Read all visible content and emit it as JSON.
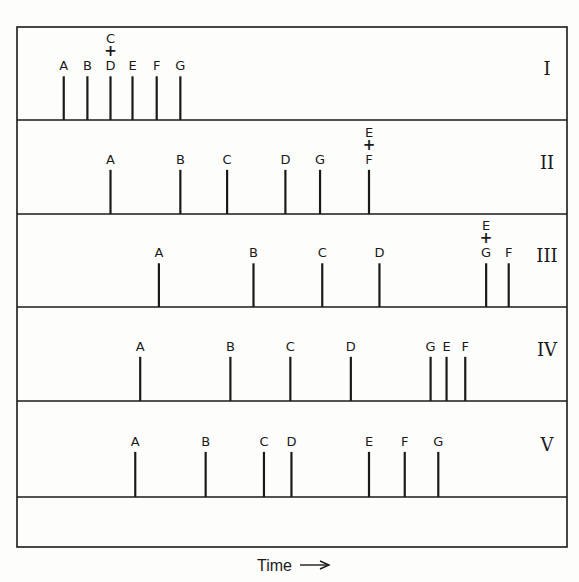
{
  "chart_data": {
    "type": "chromatogram-stick",
    "title": "",
    "xlabel": "Time",
    "x_unit": "relative elution time (arbitrary, left to right)",
    "xlim": [
      0,
      100
    ],
    "panels": [
      {
        "name": "I",
        "peaks": [
          {
            "label": "A",
            "t": 8.5
          },
          {
            "label": "B",
            "t": 12.8
          },
          {
            "label": "C+D",
            "t": 17.0,
            "stack": [
              "C",
              "D"
            ]
          },
          {
            "label": "E",
            "t": 21.0
          },
          {
            "label": "F",
            "t": 25.4
          },
          {
            "label": "G",
            "t": 29.7
          }
        ]
      },
      {
        "name": "II",
        "peaks": [
          {
            "label": "A",
            "t": 17.0
          },
          {
            "label": "B",
            "t": 29.7
          },
          {
            "label": "C",
            "t": 38.2
          },
          {
            "label": "D",
            "t": 48.8
          },
          {
            "label": "G",
            "t": 55.1
          },
          {
            "label": "E+F",
            "t": 64.0,
            "stack": [
              "E",
              "F"
            ]
          }
        ]
      },
      {
        "name": "III",
        "peaks": [
          {
            "label": "A",
            "t": 25.8
          },
          {
            "label": "B",
            "t": 43.0
          },
          {
            "label": "C",
            "t": 55.5
          },
          {
            "label": "D",
            "t": 65.9
          },
          {
            "label": "E+G",
            "t": 85.3,
            "stack": [
              "E",
              "G"
            ]
          },
          {
            "label": "F",
            "t": 89.4
          }
        ]
      },
      {
        "name": "IV",
        "peaks": [
          {
            "label": "A",
            "t": 22.4
          },
          {
            "label": "B",
            "t": 38.8
          },
          {
            "label": "C",
            "t": 49.7
          },
          {
            "label": "D",
            "t": 60.7
          },
          {
            "label": "G",
            "t": 75.2
          },
          {
            "label": "E",
            "t": 78.1
          },
          {
            "label": "F",
            "t": 81.5
          }
        ]
      },
      {
        "name": "V",
        "peaks": [
          {
            "label": "A",
            "t": 21.5
          },
          {
            "label": "B",
            "t": 34.3
          },
          {
            "label": "C",
            "t": 44.9
          },
          {
            "label": "D",
            "t": 49.9
          },
          {
            "label": "E",
            "t": 64.0
          },
          {
            "label": "F",
            "t": 70.5
          },
          {
            "label": "G",
            "t": 76.6
          }
        ]
      }
    ],
    "empty_bottom_panel": true,
    "grid": false,
    "legend": "none"
  },
  "axis": {
    "label": "Time",
    "arrow": "right-arrow"
  },
  "colors": {
    "ink": "#1a1a1a",
    "paper": "#fdfdfb"
  }
}
